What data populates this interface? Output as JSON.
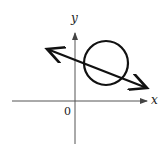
{
  "diagram": {
    "type": "coordinate-plane",
    "axes": {
      "x_label": "x",
      "y_label": "y",
      "origin_label": "0",
      "color": "#555555"
    },
    "shapes": {
      "circle": {
        "description": "circle in first quadrant",
        "stroke": "#111111"
      },
      "line": {
        "description": "line with arrows at both ends, negative slope, intersecting circle twice",
        "stroke": "#111111"
      }
    }
  }
}
